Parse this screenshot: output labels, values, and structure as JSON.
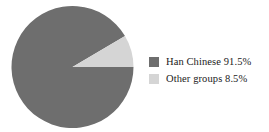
{
  "chart_data": {
    "type": "pie",
    "title": "",
    "categories": [
      "Han Chinese",
      "Other groups"
    ],
    "values": [
      91.5,
      8.5
    ],
    "value_suffix": "%",
    "colors": [
      "#6e6e6e",
      "#d5d5d5"
    ],
    "legend_position": "right",
    "grid": false,
    "start_angle_deg": 0,
    "direction": "counterclockwise",
    "series": [
      {
        "name": "Ethnic composition",
        "slices": [
          {
            "label": "Han Chinese",
            "value": 91.5,
            "display": "91.5%",
            "color": "#6e6e6e"
          },
          {
            "label": "Other groups",
            "value": 8.5,
            "display": "8.5%",
            "color": "#d5d5d5"
          }
        ]
      }
    ]
  },
  "chart": {
    "background": "#ffffff",
    "center_x": 72.5,
    "center_y": 67,
    "radius": 61
  },
  "legend": {
    "items": [
      {
        "label": "Han Chinese 91.5%",
        "color": "#6e6e6e",
        "swatch_name": "legend-swatch-han-chinese"
      },
      {
        "label": "Other groups 8.5%",
        "color": "#d5d5d5",
        "swatch_name": "legend-swatch-other-groups"
      }
    ]
  }
}
